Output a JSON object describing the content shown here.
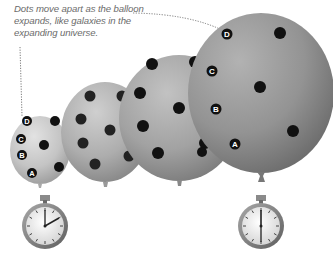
{
  "caption": {
    "lines": [
      "Dots move apart as the balloon",
      "expands, like galaxies in the",
      "expanding universe."
    ]
  },
  "labels": {
    "a": "A",
    "b": "B",
    "c": "C",
    "d": "D"
  },
  "colors": {
    "balloon_light": "#c9c9c9",
    "balloon_mid": "#a3a3a3",
    "balloon_dark": "#7f7f7f",
    "dot": "#111111",
    "leader_line": "#7a7a7a",
    "caption_text": "#6b6b6b",
    "stopwatch_rim": "#8a8a8a",
    "stopwatch_face": "#e6e6e6"
  },
  "icons": {
    "stopwatch_start": "stopwatch-icon",
    "stopwatch_end": "stopwatch-icon"
  },
  "stopwatches": [
    {
      "name": "start",
      "time_hint": "hand pointing ~2 o'clock"
    },
    {
      "name": "end",
      "time_hint": "hands pointing 12/6"
    }
  ]
}
